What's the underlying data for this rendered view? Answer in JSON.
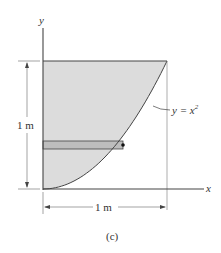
{
  "figure": {
    "caption": "(c)",
    "axis_x_label": "x",
    "axis_y_label": "y",
    "curve_label": "y = x",
    "curve_label_exponent": "2",
    "height_dimension": "1 m",
    "width_dimension": "1 m",
    "colors": {
      "shaded_region": "#dcdcdc",
      "strip": "#bdbdbd",
      "lines": "#444444"
    }
  }
}
